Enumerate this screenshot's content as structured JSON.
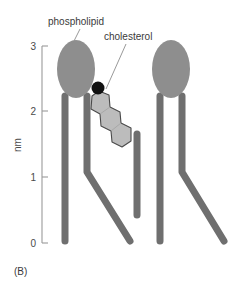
{
  "figure": {
    "panel_label": "(B)",
    "background_color": "#ffffff"
  },
  "axis": {
    "name": "nm",
    "ticks": [
      {
        "label": "3",
        "value": 3,
        "y": 46
      },
      {
        "label": "2",
        "value": 2,
        "y": 111
      },
      {
        "label": "1",
        "value": 1,
        "y": 177
      },
      {
        "label": "0",
        "value": 0,
        "y": 243
      }
    ],
    "line_x": 42,
    "line_top": 46,
    "line_bottom": 243,
    "tick_length": 6,
    "color": "#9a9a9a"
  },
  "labels": {
    "phospholipid": "phospholipid",
    "cholesterol": "cholesterol"
  },
  "colors": {
    "head": "#8e8e8e",
    "tail": "#6f6f6f",
    "sterol_body": "#bcbcbc",
    "sterol_outline": "#4a4a4a",
    "hydroxyl": "#111111",
    "text": "#3a3a3a",
    "leader": "#8d8d8d"
  },
  "molecules": {
    "phospholipid_left": {
      "name": "phospholipid-left",
      "head_cx": 76,
      "head_cy": 69,
      "head_rx": 19,
      "head_ry": 29
    },
    "phospholipid_right": {
      "name": "phospholipid-right",
      "head_cx": 171,
      "head_cy": 69,
      "head_rx": 19,
      "head_ry": 29
    },
    "cholesterol": {
      "name": "cholesterol",
      "hydroxyl_cx": 98,
      "hydroxyl_cy": 88,
      "hydroxyl_r": 6
    }
  }
}
